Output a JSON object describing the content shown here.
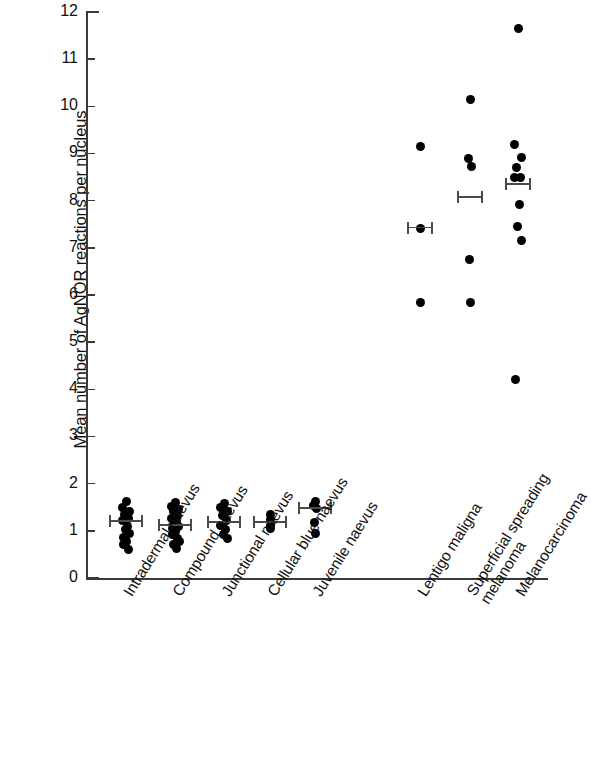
{
  "chart_data": {
    "type": "scatter",
    "title": "",
    "xlabel": "",
    "ylabel": "Mean number of AgNOR reactions per nucleus",
    "ylim": [
      0,
      12
    ],
    "ytick_labels": [
      "0",
      "1",
      "2",
      "3",
      "4",
      "5",
      "6",
      "7",
      "8",
      "9",
      "10",
      "11",
      "12"
    ],
    "ytick_values": [
      0,
      1,
      2,
      3,
      4,
      5,
      6,
      7,
      8,
      9,
      10,
      11,
      12
    ],
    "grid": false,
    "legend": "none",
    "categories": [
      "Intradermal naevus",
      "Compound naevus",
      "Junctional naevus",
      "Cellular blue naevus",
      "Juvenile naevus",
      "Lentigo maligna",
      "Superficial spreading melanoma",
      "Melanocarcinoma"
    ],
    "groups": [
      {
        "name": "Intradermal naevus",
        "label_lines": [
          "Intradermal naevus"
        ],
        "x_px": 126,
        "mean": 1.22,
        "error_low": 1.02,
        "error_high": 1.42,
        "points": [
          1.62,
          1.5,
          1.42,
          1.34,
          1.26,
          1.22,
          1.1,
          1.02,
          0.94,
          0.86,
          0.78,
          0.7,
          0.6
        ]
      },
      {
        "name": "Compound naevus",
        "label_lines": [
          "Compound naevus"
        ],
        "x_px": 175,
        "mean": 1.15,
        "error_low": 0.92,
        "error_high": 1.45,
        "points": [
          1.6,
          1.52,
          1.46,
          1.4,
          1.33,
          1.26,
          1.2,
          1.16,
          1.1,
          1.04,
          0.98,
          0.92,
          0.84,
          0.78,
          0.7,
          0.62
        ]
      },
      {
        "name": "Junctional naevus",
        "label_lines": [
          "Junctional naevus"
        ],
        "x_px": 224,
        "mean": 1.2,
        "error_low": 1.02,
        "error_high": 1.4,
        "points": [
          1.58,
          1.5,
          1.4,
          1.32,
          1.22,
          1.12,
          1.02,
          0.92,
          0.84
        ]
      },
      {
        "name": "Cellular blue naevus",
        "label_lines": [
          "Cellular blue naevus"
        ],
        "x_px": 270,
        "mean": 1.2,
        "error_low": 1.08,
        "error_high": 1.33,
        "points": [
          1.34,
          1.24,
          1.12,
          1.04
        ]
      },
      {
        "name": "Juvenile naevus",
        "label_lines": [
          "Juvenile naevus"
        ],
        "x_px": 315,
        "mean": 1.5,
        "error_low": 1.3,
        "error_high": 1.7,
        "points": [
          1.62,
          1.54,
          1.48,
          1.18,
          0.94
        ]
      },
      {
        "name": "Lentigo maligna",
        "label_lines": [
          "Lentigo maligna"
        ],
        "x_px": 420,
        "mean": 7.45,
        "error_low": 7.18,
        "error_high": 7.72,
        "points": [
          9.15,
          7.4,
          5.85
        ]
      },
      {
        "name": "Superficial spreading melanoma",
        "label_lines": [
          "Superficial spreading",
          "melanoma"
        ],
        "x_px": 470,
        "mean": 8.1,
        "error_low": 7.92,
        "error_high": 8.3,
        "points": [
          10.15,
          8.9,
          8.72,
          6.75,
          5.85
        ]
      },
      {
        "name": "Melanocarcinoma",
        "label_lines": [
          "Melanocarcinoma"
        ],
        "x_px": 518,
        "mean": 8.38,
        "error_low": 8.18,
        "error_high": 8.6,
        "points": [
          11.65,
          9.18,
          8.92,
          8.7,
          8.5,
          8.48,
          7.92,
          7.45,
          7.15,
          4.2
        ]
      }
    ],
    "colors": {
      "point": "#000000",
      "axis": "#3a3a3a",
      "errorbar": "#4a4a4a",
      "text": "#111111",
      "background": "#ffffff"
    }
  },
  "geometry": {
    "axis_x_px": 86,
    "axis_top_px": 12,
    "axis_bottom_px": 578,
    "axis_right_px": 548,
    "px_per_unit": 47.17
  }
}
